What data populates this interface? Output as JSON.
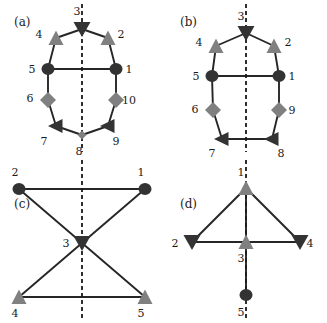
{
  "figure": {
    "width": 327,
    "height": 323,
    "background": "#ffffff",
    "colors": {
      "dark": "#333333",
      "gray": "#808080",
      "edge": "#262626",
      "axis": "#1a1a1a",
      "text": "#1a1a1a"
    },
    "panels": [
      {
        "id": "a",
        "label": "(a)",
        "label_pos": {
          "x": 14,
          "y": 26
        },
        "symmetry_axis": {
          "x": 82,
          "y1": 4,
          "y2": 152,
          "style": "dashed"
        },
        "nodes": [
          {
            "id": "1",
            "shape": "circle",
            "color": "dark",
            "x": 116,
            "y": 69,
            "label": "1",
            "label_pos": {
              "x": 129,
              "y": 73
            }
          },
          {
            "id": "2",
            "shape": "triangle-up",
            "color": "gray",
            "x": 108,
            "y": 38,
            "label": "2",
            "label_pos": {
              "x": 121,
              "y": 38
            }
          },
          {
            "id": "3",
            "shape": "triangle-down",
            "color": "dark",
            "x": 82,
            "y": 29,
            "label": "3",
            "label_pos": {
              "x": 77,
              "y": 15
            }
          },
          {
            "id": "4",
            "shape": "triangle-up",
            "color": "gray",
            "x": 56,
            "y": 38,
            "label": "4",
            "label_pos": {
              "x": 39,
              "y": 38
            }
          },
          {
            "id": "5",
            "shape": "circle",
            "color": "dark",
            "x": 48,
            "y": 69,
            "label": "5",
            "label_pos": {
              "x": 32,
              "y": 73
            }
          },
          {
            "id": "6",
            "shape": "diamond",
            "color": "gray",
            "x": 48,
            "y": 100,
            "label": "6",
            "label_pos": {
              "x": 30,
              "y": 102
            }
          },
          {
            "id": "7",
            "shape": "triangle-left",
            "color": "dark",
            "x": 56,
            "y": 126,
            "label": "7",
            "label_pos": {
              "x": 44,
              "y": 145
            }
          },
          {
            "id": "8",
            "shape": "diamond-small",
            "color": "gray",
            "x": 82,
            "y": 135,
            "label": "8",
            "label_pos": {
              "x": 79,
              "y": 155
            }
          },
          {
            "id": "9",
            "shape": "triangle-left",
            "color": "dark",
            "x": 108,
            "y": 126,
            "label": "9",
            "label_pos": {
              "x": 116,
              "y": 145
            }
          },
          {
            "id": "10",
            "shape": "diamond",
            "color": "gray",
            "x": 116,
            "y": 100,
            "label": "10",
            "label_pos": {
              "x": 129,
              "y": 104
            }
          }
        ],
        "edges": [
          [
            "1",
            "2"
          ],
          [
            "2",
            "3"
          ],
          [
            "3",
            "4"
          ],
          [
            "4",
            "5"
          ],
          [
            "5",
            "6"
          ],
          [
            "6",
            "7"
          ],
          [
            "7",
            "8"
          ],
          [
            "8",
            "9"
          ],
          [
            "9",
            "10"
          ],
          [
            "10",
            "1"
          ],
          [
            "5",
            "1"
          ]
        ]
      },
      {
        "id": "b",
        "label": "(b)",
        "label_pos": {
          "x": 180,
          "y": 26
        },
        "symmetry_axis": {
          "x": 246,
          "y1": 4,
          "y2": 152,
          "style": "dashed"
        },
        "nodes": [
          {
            "id": "1",
            "shape": "circle",
            "color": "dark",
            "x": 279,
            "y": 76,
            "label": "1",
            "label_pos": {
              "x": 292,
              "y": 80
            }
          },
          {
            "id": "2",
            "shape": "triangle-up",
            "color": "gray",
            "x": 274,
            "y": 46,
            "label": "2",
            "label_pos": {
              "x": 288,
              "y": 46
            }
          },
          {
            "id": "3",
            "shape": "triangle-down",
            "color": "dark",
            "x": 246,
            "y": 33,
            "label": "3",
            "label_pos": {
              "x": 241,
              "y": 20
            }
          },
          {
            "id": "4",
            "shape": "triangle-up",
            "color": "gray",
            "x": 216,
            "y": 46,
            "label": "4",
            "label_pos": {
              "x": 199,
              "y": 46
            }
          },
          {
            "id": "5",
            "shape": "circle",
            "color": "dark",
            "x": 212,
            "y": 76,
            "label": "5",
            "label_pos": {
              "x": 196,
              "y": 80
            }
          },
          {
            "id": "6",
            "shape": "diamond",
            "color": "gray",
            "x": 213,
            "y": 110,
            "label": "6",
            "label_pos": {
              "x": 195,
              "y": 113
            }
          },
          {
            "id": "7",
            "shape": "triangle-left",
            "color": "dark",
            "x": 222,
            "y": 139,
            "label": "7",
            "label_pos": {
              "x": 212,
              "y": 157
            }
          },
          {
            "id": "8",
            "shape": "triangle-left",
            "color": "dark",
            "x": 272,
            "y": 139,
            "label": "8",
            "label_pos": {
              "x": 281,
              "y": 157
            }
          },
          {
            "id": "9",
            "shape": "diamond",
            "color": "gray",
            "x": 279,
            "y": 110,
            "label": "9",
            "label_pos": {
              "x": 292,
              "y": 114
            }
          }
        ],
        "edges": [
          [
            "1",
            "2"
          ],
          [
            "2",
            "3"
          ],
          [
            "3",
            "4"
          ],
          [
            "4",
            "5"
          ],
          [
            "5",
            "6"
          ],
          [
            "6",
            "7"
          ],
          [
            "7",
            "8"
          ],
          [
            "8",
            "9"
          ],
          [
            "9",
            "1"
          ],
          [
            "5",
            "1"
          ]
        ]
      },
      {
        "id": "c",
        "label": "(c)",
        "label_pos": {
          "x": 14,
          "y": 208
        },
        "symmetry_axis": {
          "x": 82,
          "y1": 160,
          "y2": 318,
          "style": "dashed"
        },
        "nodes": [
          {
            "id": "1",
            "shape": "circle",
            "color": "dark",
            "x": 145,
            "y": 189,
            "label": "1",
            "label_pos": {
              "x": 141,
              "y": 176
            }
          },
          {
            "id": "2",
            "shape": "circle",
            "color": "dark",
            "x": 19,
            "y": 189,
            "label": "2",
            "label_pos": {
              "x": 15,
              "y": 176
            }
          },
          {
            "id": "3",
            "shape": "triangle-down",
            "color": "dark",
            "x": 82,
            "y": 243,
            "label": "3",
            "label_pos": {
              "x": 66,
              "y": 247
            }
          },
          {
            "id": "4",
            "shape": "triangle-up",
            "color": "gray",
            "x": 19,
            "y": 297,
            "label": "4",
            "label_pos": {
              "x": 15,
              "y": 317
            }
          },
          {
            "id": "5",
            "shape": "triangle-up",
            "color": "gray",
            "x": 145,
            "y": 297,
            "label": "5",
            "label_pos": {
              "x": 141,
              "y": 317
            }
          }
        ],
        "edges": [
          [
            "2",
            "1"
          ],
          [
            "2",
            "3"
          ],
          [
            "1",
            "3"
          ],
          [
            "3",
            "4"
          ],
          [
            "3",
            "5"
          ],
          [
            "4",
            "5"
          ]
        ]
      },
      {
        "id": "d",
        "label": "(d)",
        "label_pos": {
          "x": 180,
          "y": 208
        },
        "symmetry_axis": {
          "x": 246,
          "y1": 160,
          "y2": 318,
          "style": "dashed"
        },
        "nodes": [
          {
            "id": "1",
            "shape": "triangle-up",
            "color": "gray",
            "x": 246,
            "y": 188,
            "label": "1",
            "label_pos": {
              "x": 241,
              "y": 176
            }
          },
          {
            "id": "2",
            "shape": "triangle-down",
            "color": "dark",
            "x": 192,
            "y": 242,
            "label": "2",
            "label_pos": {
              "x": 175,
              "y": 247
            }
          },
          {
            "id": "3",
            "shape": "triangle-up",
            "color": "gray",
            "x": 246,
            "y": 242,
            "label": "3",
            "label_pos": {
              "x": 241,
              "y": 262
            }
          },
          {
            "id": "4",
            "shape": "triangle-down",
            "color": "dark",
            "x": 300,
            "y": 242,
            "label": "4",
            "label_pos": {
              "x": 310,
              "y": 247
            }
          },
          {
            "id": "5",
            "shape": "circle",
            "color": "dark",
            "x": 246,
            "y": 295,
            "label": "5",
            "label_pos": {
              "x": 241,
              "y": 316
            }
          }
        ],
        "edges": [
          [
            "1",
            "2"
          ],
          [
            "1",
            "4"
          ],
          [
            "1",
            "3"
          ],
          [
            "2",
            "3"
          ],
          [
            "3",
            "4"
          ],
          [
            "3",
            "5"
          ]
        ]
      }
    ]
  }
}
